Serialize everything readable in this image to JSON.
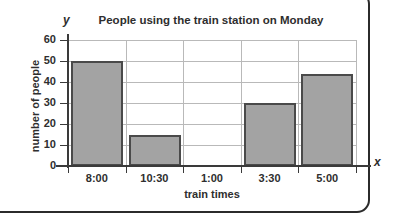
{
  "chart_data": {
    "type": "bar",
    "title": "People using the train station on Monday",
    "xlabel": "train times",
    "ylabel": "number of people",
    "categories": [
      "8:00",
      "10:30",
      "1:00",
      "3:30",
      "5:00"
    ],
    "values": [
      50,
      15,
      0,
      30,
      44
    ],
    "ylim": [
      0,
      60
    ],
    "yticks": [
      0,
      10,
      20,
      30,
      40,
      50,
      60
    ],
    "ytick_labels": [
      "0",
      "10",
      "20",
      "30",
      "40",
      "50",
      "60"
    ],
    "grid": true,
    "legend": "none",
    "axis_symbols": {
      "x": "x",
      "y": "y"
    },
    "colors": {
      "bar_fill": "#a3a3a3",
      "bar_border": "#4a4a4a",
      "grid": "#b9b9b9",
      "axis": "#3a3a3a",
      "text": "#2e2e2e",
      "frame": "#2b2b2b",
      "background": "#ffffff"
    }
  }
}
